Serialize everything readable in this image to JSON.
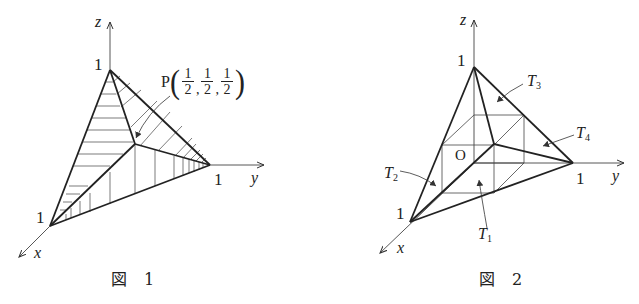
{
  "figures": [
    {
      "id": "fig1",
      "caption": "図 1",
      "axes": {
        "x": "x",
        "y": "y",
        "z": "z"
      },
      "ticks": {
        "x": "1",
        "y": "1",
        "z": "1"
      },
      "point": {
        "label": "P",
        "coords": [
          {
            "num": "1",
            "den": "2"
          },
          {
            "num": "1",
            "den": "2"
          },
          {
            "num": "1",
            "den": "2"
          }
        ],
        "separator": ","
      }
    },
    {
      "id": "fig2",
      "caption": "図 2",
      "axes": {
        "x": "x",
        "y": "y",
        "z": "z"
      },
      "ticks": {
        "x": "1",
        "y": "1",
        "z": "1"
      },
      "origin_label": "O",
      "regions": [
        {
          "name": "T",
          "sub": "1"
        },
        {
          "name": "T",
          "sub": "2"
        },
        {
          "name": "T",
          "sub": "3"
        },
        {
          "name": "T",
          "sub": "4"
        }
      ]
    }
  ]
}
